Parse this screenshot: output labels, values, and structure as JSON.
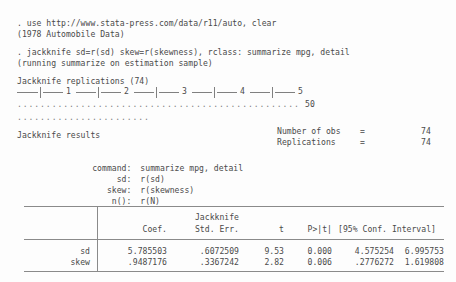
{
  "console": {
    "commands": {
      "use_line": ". use http://www.stata-press.com/data/r11/auto, clear",
      "use_output": "(1978 Automobile Data)",
      "jackknife_line": ". jackknife sd=r(sd) skew=r(skewness), rclass: summarize mpg, detail",
      "jackknife_output": "(running summarize on estimation sample)"
    },
    "progress": {
      "title": "Jackknife replications (74)",
      "ruler_numbers": [
        "1",
        "2",
        "3",
        "4",
        "5"
      ],
      "dots_row1": ".................................................",
      "dots_row2": ".......................",
      "dots_count_label": "50"
    },
    "results_header": {
      "title": "Jackknife results",
      "stats": [
        {
          "label": "Number of obs",
          "eq": "=",
          "value": "74"
        },
        {
          "label": "Replications",
          "eq": "=",
          "value": "74"
        }
      ]
    },
    "definitions": [
      {
        "label": "command:",
        "value": "summarize mpg, detail"
      },
      {
        "label": "sd:",
        "value": "r(sd)"
      },
      {
        "label": "skew:",
        "value": "r(skewness)"
      },
      {
        "label": "n():",
        "value": "r(N)"
      }
    ],
    "table": {
      "header_top": {
        "std_err": "Jackknife"
      },
      "headers": {
        "coef": "Coef.",
        "std_err": "Std. Err.",
        "t": "t",
        "p": "P>|t|",
        "ci": "[95% Conf. Interval]"
      },
      "rows": [
        {
          "label": "sd",
          "coef": "5.785503",
          "std_err": ".6072509",
          "t": "9.53",
          "p": "0.000",
          "ci_low": "4.575254",
          "ci_high": "6.995753"
        },
        {
          "label": "skew",
          "coef": ".9487176",
          "std_err": ".3367242",
          "t": "2.82",
          "p": "0.006",
          "ci_low": ".2776272",
          "ci_high": "1.619808"
        }
      ]
    }
  },
  "colors": {
    "background": "#fdfdfd",
    "text": "#4a4a4a",
    "rule": "#8a8a8a",
    "dots": "#7d7d7d"
  }
}
